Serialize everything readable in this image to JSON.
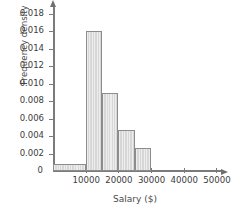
{
  "chart_data": {
    "type": "bar",
    "title": "",
    "subtitle": "",
    "xlabel": "Salary ($)",
    "ylabel": "Frequency density",
    "xlim": [
      0,
      52000
    ],
    "ylim": [
      0,
      0.019
    ],
    "grid": false,
    "legend": null,
    "x_ticks": [
      {
        "value": 10000,
        "label": "10000"
      },
      {
        "value": 20000,
        "label": "20000"
      },
      {
        "value": 30000,
        "label": "30000"
      },
      {
        "value": 40000,
        "label": "40000"
      },
      {
        "value": 50000,
        "label": "50000"
      }
    ],
    "y_ticks": [
      {
        "value": 0,
        "label": "0"
      },
      {
        "value": 0.002,
        "label": "0.002"
      },
      {
        "value": 0.004,
        "label": "0.004"
      },
      {
        "value": 0.006,
        "label": "0.006"
      },
      {
        "value": 0.008,
        "label": "0.008"
      },
      {
        "value": 0.01,
        "label": "0.010"
      },
      {
        "value": 0.012,
        "label": "0.012"
      },
      {
        "value": 0.014,
        "label": "0.014"
      },
      {
        "value": 0.016,
        "label": "0.016"
      },
      {
        "value": 0.018,
        "label": "0.018"
      }
    ],
    "bins": [
      {
        "start": 0,
        "end": 10000,
        "value": 0.0008
      },
      {
        "start": 10000,
        "end": 15000,
        "value": 0.016
      },
      {
        "start": 15000,
        "end": 20000,
        "value": 0.0089
      },
      {
        "start": 20000,
        "end": 25000,
        "value": 0.0047
      },
      {
        "start": 25000,
        "end": 30000,
        "value": 0.0027
      }
    ],
    "categories": [
      "0-10000",
      "10000-15000",
      "15000-20000",
      "20000-25000",
      "25000-30000"
    ],
    "values": [
      0.0008,
      0.016,
      0.0089,
      0.0047,
      0.0027
    ],
    "colors": {
      "bar_fill": "#d7d7d7",
      "bar_border": "#8c8c8c",
      "axis": "#7b7b7b",
      "text": "#3c3c3c",
      "background": "#ffffff"
    }
  }
}
